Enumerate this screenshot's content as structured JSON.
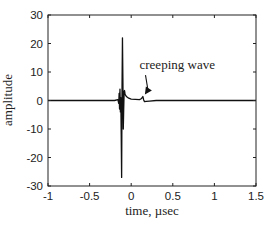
{
  "chart_data": {
    "type": "line",
    "title": "",
    "xlabel": "time, µsec",
    "ylabel": "amplitude",
    "xlim": [
      -1,
      1.5
    ],
    "ylim": [
      -30,
      30
    ],
    "xticks": [
      -1,
      -0.5,
      0,
      0.5,
      1,
      1.5
    ],
    "xtick_labels": [
      "-1",
      "-0.5",
      "0",
      "0.5",
      "1",
      "1.5"
    ],
    "yticks": [
      -30,
      -20,
      -10,
      0,
      10,
      20,
      30
    ],
    "ytick_labels": [
      "-30",
      "-20",
      "-10",
      "0",
      "10",
      "20",
      "30"
    ],
    "grid": false,
    "legend": null,
    "series": [
      {
        "name": "signal",
        "color": "#111111",
        "x": [
          -1.0,
          -0.2,
          -0.16,
          -0.15,
          -0.145,
          -0.14,
          -0.135,
          -0.13,
          -0.125,
          -0.12,
          -0.115,
          -0.11,
          -0.105,
          -0.1,
          -0.095,
          -0.09,
          -0.085,
          -0.08,
          -0.075,
          -0.07,
          -0.06,
          -0.05,
          -0.03,
          0.0,
          0.05,
          0.1,
          0.12,
          0.14,
          0.15,
          0.16,
          0.18,
          0.22,
          0.3,
          0.35,
          1.5
        ],
        "values": [
          0,
          0,
          0.3,
          -1,
          2.5,
          -3,
          4,
          -4,
          1,
          -12,
          -27,
          5,
          22,
          8,
          -10,
          -3,
          3,
          3.5,
          2.5,
          2,
          1.5,
          1.2,
          0.8,
          0.5,
          0.4,
          0.3,
          0.6,
          1.4,
          0.2,
          -0.4,
          -0.3,
          -0.2,
          0,
          0,
          0
        ]
      }
    ],
    "annotations": [
      {
        "text": "creeping wave",
        "xy": [
          0.14,
          1.4
        ],
        "xytext": [
          0.22,
          11
        ],
        "arrow": true
      }
    ]
  }
}
